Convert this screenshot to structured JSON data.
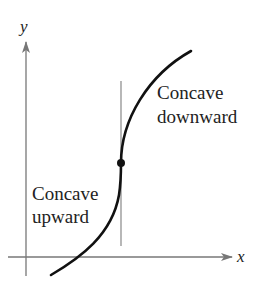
{
  "diagram": {
    "title": "",
    "axes": {
      "x_label": "x",
      "y_label": "y"
    },
    "regions": {
      "left": {
        "line1": "Concave",
        "line2": "upward"
      },
      "right": {
        "line1": "Concave",
        "line2": "downward"
      }
    },
    "inflection_point": {
      "marked": true
    },
    "colors": {
      "curve": "#111111",
      "axis": "#777777",
      "divider": "#888888",
      "text": "#222222"
    }
  }
}
